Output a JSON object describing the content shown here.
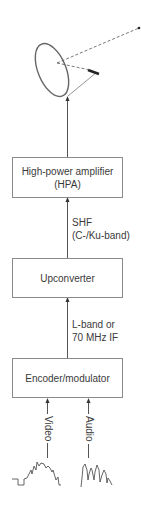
{
  "diagram": {
    "blocks": [
      {
        "id": "hpa",
        "line1": "High-power amplifier",
        "line2": "(HPA)"
      },
      {
        "id": "upconverter",
        "line1": "Upconverter"
      },
      {
        "id": "encoder",
        "line1": "Encoder/modulator"
      }
    ],
    "links": [
      {
        "from": "upconverter",
        "to": "hpa",
        "line1": "SHF",
        "line2": "(C-/Ku-band)"
      },
      {
        "from": "encoder",
        "to": "upconverter",
        "line1": "L-band or",
        "line2": "70 MHz IF"
      }
    ],
    "inputs": [
      {
        "name": "video",
        "label": "Video"
      },
      {
        "name": "audio",
        "label": "Audio"
      }
    ],
    "antenna": {
      "type": "satellite-dish",
      "beam": "uplink-to-satellite"
    },
    "colors": {
      "line": "#555555",
      "box_border": "#8a8a8a",
      "text": "#3a3a3a"
    }
  }
}
